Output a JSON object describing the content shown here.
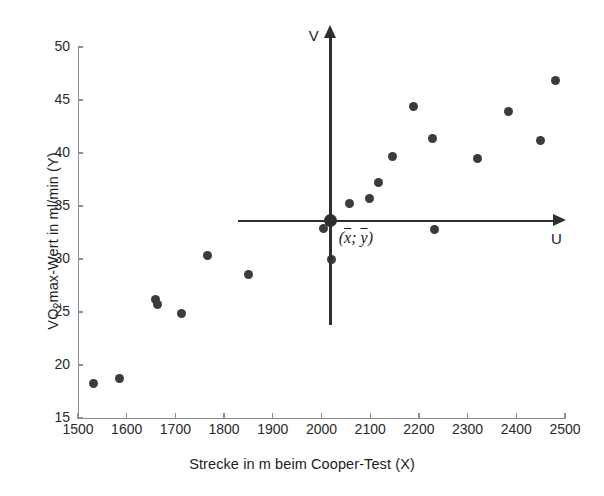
{
  "chart_data": {
    "type": "scatter",
    "title": "",
    "xlabel": "Strecke in m beim Cooper-Test (X)",
    "ylabel": "VO2max-Wert in ml/min (Y)",
    "ylabel_prefix": "VO",
    "ylabel_subscript": "2",
    "ylabel_suffix": "max-Wert in ml/min (Y)",
    "xlim": [
      1500,
      2500
    ],
    "ylim": [
      15,
      50
    ],
    "xticks": [
      1500,
      1600,
      1700,
      1800,
      1900,
      2000,
      2100,
      2200,
      2300,
      2400,
      2500
    ],
    "yticks": [
      15,
      20,
      25,
      30,
      35,
      40,
      45,
      50
    ],
    "grid": false,
    "legend": null,
    "marker_color": "#3b3b3b",
    "axis_color": "#8d8d8d",
    "points": [
      {
        "x": 1532,
        "y": 18.3
      },
      {
        "x": 1585,
        "y": 18.7
      },
      {
        "x": 1660,
        "y": 26.2
      },
      {
        "x": 1663,
        "y": 25.7
      },
      {
        "x": 1712,
        "y": 24.9
      },
      {
        "x": 1765,
        "y": 30.3
      },
      {
        "x": 1850,
        "y": 28.5
      },
      {
        "x": 2005,
        "y": 32.9
      },
      {
        "x": 2020,
        "y": 30.0
      },
      {
        "x": 2058,
        "y": 35.2
      },
      {
        "x": 2098,
        "y": 35.7
      },
      {
        "x": 2118,
        "y": 37.2
      },
      {
        "x": 2145,
        "y": 39.7
      },
      {
        "x": 2188,
        "y": 44.4
      },
      {
        "x": 2228,
        "y": 41.4
      },
      {
        "x": 2232,
        "y": 32.8
      },
      {
        "x": 2320,
        "y": 39.5
      },
      {
        "x": 2385,
        "y": 43.9
      },
      {
        "x": 2450,
        "y": 41.2
      },
      {
        "x": 2480,
        "y": 46.8
      }
    ],
    "annotations": {
      "centroid": {
        "x": 2019,
        "y": 33.6,
        "label": "(x̄; ȳ)",
        "label_x_part": "x",
        "label_y_part": "y"
      },
      "overlay_axes": {
        "u_label": "U",
        "v_label": "V",
        "description": "translated U-V coordinate system centred on the centroid"
      }
    }
  },
  "overlay": {
    "u_label": "U",
    "v_label": "V",
    "centroid_label_open": "(",
    "centroid_label_x": "x",
    "centroid_label_sep": "; ",
    "centroid_label_y": "y",
    "centroid_label_close": ")"
  }
}
